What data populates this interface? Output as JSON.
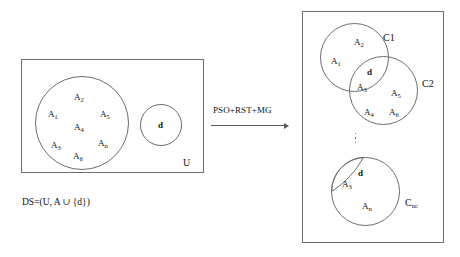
{
  "figure": {
    "left_panel": {
      "universe_label": "U",
      "caption": "DS=(U, A ∪ {d})",
      "attribute_circle": {
        "labels": [
          {
            "base": "A",
            "sub": "2"
          },
          {
            "base": "A",
            "sub": "1"
          },
          {
            "base": "A",
            "sub": "5"
          },
          {
            "base": "A",
            "sub": "4"
          },
          {
            "base": "A",
            "sub": "3"
          },
          {
            "base": "A",
            "sub": "n"
          },
          {
            "base": "A",
            "sub": "6"
          }
        ]
      },
      "decision_circle": {
        "label": "d"
      }
    },
    "transform": {
      "label": "PSO+RST+MG",
      "arrow": "right-arrow"
    },
    "right_panel": {
      "cluster_c1": {
        "name": "C1",
        "labels": [
          {
            "base": "A",
            "sub": "2"
          },
          {
            "base": "A",
            "sub": "1"
          }
        ]
      },
      "cluster_c2": {
        "name": "C2",
        "labels": [
          {
            "base": "A",
            "sub": "5"
          },
          {
            "base": "A",
            "sub": "4"
          },
          {
            "base": "A",
            "sub": "6"
          }
        ]
      },
      "overlap_c1_c2": {
        "decision": "d",
        "labels": [
          {
            "base": "A",
            "sub": "3"
          }
        ]
      },
      "cluster_cnc": {
        "name": "C",
        "name_sub": "nc",
        "decision": "d",
        "labels": [
          {
            "base": "A",
            "sub": "3"
          },
          {
            "base": "A",
            "sub": "n"
          }
        ]
      },
      "ellipsis": "vertical-ellipsis"
    }
  },
  "colors": {
    "stroke": "#6d6d6d",
    "text": "#111111",
    "background": "#ffffff"
  }
}
